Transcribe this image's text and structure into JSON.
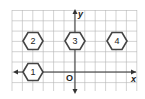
{
  "diagram": {
    "type": "coordinate-grid",
    "axes": {
      "x_label": "x",
      "y_label": "y",
      "origin_label": "O"
    },
    "hexagons": [
      {
        "label": "1",
        "cx": 33,
        "cy": 72
      },
      {
        "label": "2",
        "cx": 33,
        "cy": 41
      },
      {
        "label": "3",
        "cx": 75,
        "cy": 41
      },
      {
        "label": "4",
        "cx": 117,
        "cy": 41
      }
    ],
    "colors": {
      "grid": "#b5b5b5",
      "axis": "#333333",
      "hex_fill": "#e6e6e6",
      "hex_stroke": "#444444"
    }
  }
}
